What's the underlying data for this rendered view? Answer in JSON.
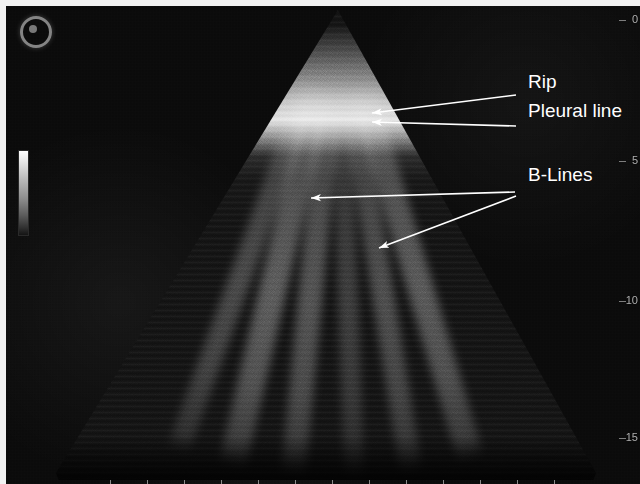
{
  "modality": "lung-ultrasound-b-mode",
  "annotations": [
    {
      "id": "rip",
      "label": "Rip",
      "x": 528,
      "y": 88
    },
    {
      "id": "pleural-line",
      "label": "Pleural line",
      "x": 528,
      "y": 117
    },
    {
      "id": "b-lines",
      "label": "B-Lines",
      "x": 528,
      "y": 181
    }
  ],
  "arrows": [
    {
      "id": "arrow-rip",
      "points": "516,95 372,113",
      "head": "372,113"
    },
    {
      "id": "arrow-pleural",
      "points": "516,126 372,122",
      "head": "372,122"
    },
    {
      "id": "arrow-bline-1",
      "points": "515,192 311,198",
      "head": "311,198"
    },
    {
      "id": "arrow-bline-2",
      "points": "516,196 379,248",
      "head": "379,248"
    }
  ],
  "depth_scale": {
    "unit": "cm",
    "marks": [
      {
        "value": "0",
        "y": 14
      },
      {
        "value": "5",
        "y": 155
      },
      {
        "value": "10",
        "y": 295
      },
      {
        "value": "15",
        "y": 432
      }
    ]
  },
  "gain_bar": {
    "name": "grayscale-gain-bar",
    "top_value": "max",
    "bottom_value": "min"
  },
  "logo": {
    "name": "manufacturer-logo"
  },
  "bottom_ruler": {
    "tick_count": 13,
    "start_x": 104,
    "spacing": 37
  },
  "b_lines": [
    {
      "angle": -16.5,
      "width": 26,
      "opacity": 0.5
    },
    {
      "angle": -9.0,
      "width": 22,
      "opacity": 0.42
    },
    {
      "angle": -2.0,
      "width": 20,
      "opacity": 0.3
    },
    {
      "angle": 5.5,
      "width": 24,
      "opacity": 0.46
    },
    {
      "angle": 13.0,
      "width": 27,
      "opacity": 0.52
    },
    {
      "angle": 20.0,
      "width": 22,
      "opacity": 0.38
    }
  ],
  "colors": {
    "annotation_text": "#ffffff",
    "arrow_stroke": "#ffffff",
    "scale_text": "#c9c9c9",
    "background": "#070707",
    "pleural_line": "#ebebeb"
  }
}
